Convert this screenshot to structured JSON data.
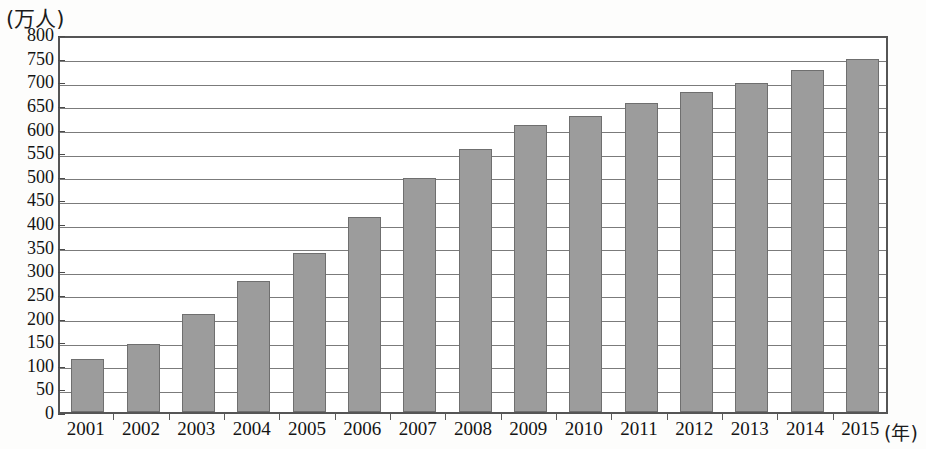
{
  "chart_data": {
    "type": "bar",
    "title": "",
    "subtitle": "",
    "xlabel": "(年)",
    "ylabel": "(万人)",
    "categories": [
      "2001",
      "2002",
      "2003",
      "2004",
      "2005",
      "2006",
      "2007",
      "2008",
      "2009",
      "2010",
      "2011",
      "2012",
      "2013",
      "2014",
      "2015"
    ],
    "values": [
      112,
      143,
      208,
      277,
      337,
      412,
      495,
      556,
      608,
      626,
      655,
      677,
      697,
      723,
      747
    ],
    "ylim": [
      0,
      800
    ],
    "ytick_step": 50,
    "ytick_labels": [
      "800",
      "750",
      "700",
      "650",
      "600",
      "550",
      "500",
      "450",
      "400",
      "350",
      "300",
      "250",
      "200",
      "150",
      "100",
      "50",
      "0"
    ],
    "grid": true,
    "legend": "none",
    "bar_color": "#9c9c9c",
    "bar_border_color": "#6f6f6f",
    "gridline_color": "#7b7b7b",
    "frame_color": "#555555",
    "background_color": "#ffffff"
  },
  "axes": {
    "y_unit_label": "(万人)",
    "x_unit_label": "(年)"
  }
}
